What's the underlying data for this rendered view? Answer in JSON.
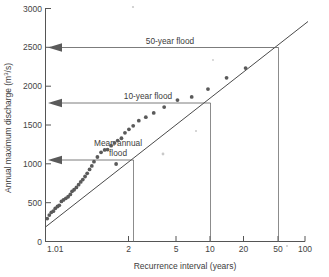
{
  "figure": {
    "title": "",
    "background": "#ffffff",
    "plot_area_px": {
      "left": 45,
      "right": 305,
      "top": 8,
      "bottom": 242
    }
  },
  "axes": {
    "y": {
      "label": "Annual maximum discharge (m³/s)",
      "label_plain": "Annual maximum discharge (m3/s)",
      "ticks": [
        0,
        500,
        1000,
        1500,
        2000,
        2500,
        3000
      ],
      "tick_labels": [
        "0",
        "500",
        "1000",
        "1500",
        "2000",
        "2500",
        "3000"
      ],
      "min": 0,
      "max": 3000,
      "scale": "linear"
    },
    "x": {
      "label": "Recurrence interval (years)",
      "ticks": [
        1.01,
        2,
        5,
        10,
        20,
        50,
        100
      ],
      "tick_labels": [
        "1.01",
        "2",
        "5",
        "10",
        "20",
        "50",
        "100"
      ],
      "min": 1.01,
      "max": 100,
      "scale": "log"
    }
  },
  "annotations": [
    {
      "id": "mean-annual-flood",
      "label": "Mean annual flood",
      "label_lines": [
        "Mean annual",
        "flood"
      ],
      "recurrence_years": 2.33,
      "discharge": 1050,
      "arrow": "left"
    },
    {
      "id": "ten-year-flood",
      "label": "10-year flood",
      "label_lines": [
        "10-year flood"
      ],
      "recurrence_years": 10,
      "discharge": 1780,
      "arrow": "left"
    },
    {
      "id": "fifty-year-flood",
      "label": "50-year flood",
      "label_lines": [
        "50-year flood"
      ],
      "recurrence_years": 50,
      "discharge": 2500,
      "arrow": "left"
    }
  ],
  "chart_data": {
    "type": "scatter",
    "title": "",
    "xlabel": "Recurrence interval (years)",
    "ylabel": "Annual maximum discharge (m³/s)",
    "xlim": [
      1.01,
      100
    ],
    "ylim": [
      0,
      3000
    ],
    "xscale": "log",
    "yscale": "linear",
    "grid": false,
    "legend": "none",
    "series": [
      {
        "name": "Annual maximum discharge observations",
        "marker": "circle",
        "color": "#5a5a5a",
        "points": [
          {
            "x": 1.05,
            "y": 300
          },
          {
            "x": 1.09,
            "y": 345
          },
          {
            "x": 1.13,
            "y": 380
          },
          {
            "x": 1.17,
            "y": 395
          },
          {
            "x": 1.21,
            "y": 430
          },
          {
            "x": 1.26,
            "y": 455
          },
          {
            "x": 1.3,
            "y": 470
          },
          {
            "x": 1.35,
            "y": 520
          },
          {
            "x": 1.4,
            "y": 540
          },
          {
            "x": 1.46,
            "y": 560
          },
          {
            "x": 1.52,
            "y": 580
          },
          {
            "x": 1.58,
            "y": 610
          },
          {
            "x": 1.63,
            "y": 650
          },
          {
            "x": 1.69,
            "y": 670
          },
          {
            "x": 1.76,
            "y": 700
          },
          {
            "x": 1.83,
            "y": 735
          },
          {
            "x": 1.9,
            "y": 770
          },
          {
            "x": 1.97,
            "y": 800
          },
          {
            "x": 2.05,
            "y": 840
          },
          {
            "x": 2.13,
            "y": 880
          },
          {
            "x": 2.22,
            "y": 930
          },
          {
            "x": 2.31,
            "y": 975
          },
          {
            "x": 2.4,
            "y": 1030
          },
          {
            "x": 2.55,
            "y": 1090
          },
          {
            "x": 2.72,
            "y": 1150
          },
          {
            "x": 2.9,
            "y": 1180
          },
          {
            "x": 3.05,
            "y": 1185
          },
          {
            "x": 3.25,
            "y": 1235
          },
          {
            "x": 3.45,
            "y": 1270
          },
          {
            "x": 3.65,
            "y": 1300
          },
          {
            "x": 3.9,
            "y": 1330
          },
          {
            "x": 4.15,
            "y": 1400
          },
          {
            "x": 4.45,
            "y": 1445
          },
          {
            "x": 4.8,
            "y": 1490
          },
          {
            "x": 5.3,
            "y": 1555
          },
          {
            "x": 6.0,
            "y": 1600
          },
          {
            "x": 6.9,
            "y": 1655
          },
          {
            "x": 8.3,
            "y": 1730
          },
          {
            "x": 10.5,
            "y": 1820
          },
          {
            "x": 13.5,
            "y": 1860
          },
          {
            "x": 18.0,
            "y": 1960
          },
          {
            "x": 25.0,
            "y": 2105
          },
          {
            "x": 35.0,
            "y": 2230
          },
          {
            "x": 3.55,
            "y": 1000
          }
        ]
      }
    ],
    "trendline": {
      "name": "Fitted frequency line",
      "type": "straight-on-log-x",
      "color": "#4a4a4a",
      "endpoints": [
        {
          "x": 1.01,
          "y": 195
        },
        {
          "x": 100,
          "y": 2830
        }
      ]
    }
  }
}
